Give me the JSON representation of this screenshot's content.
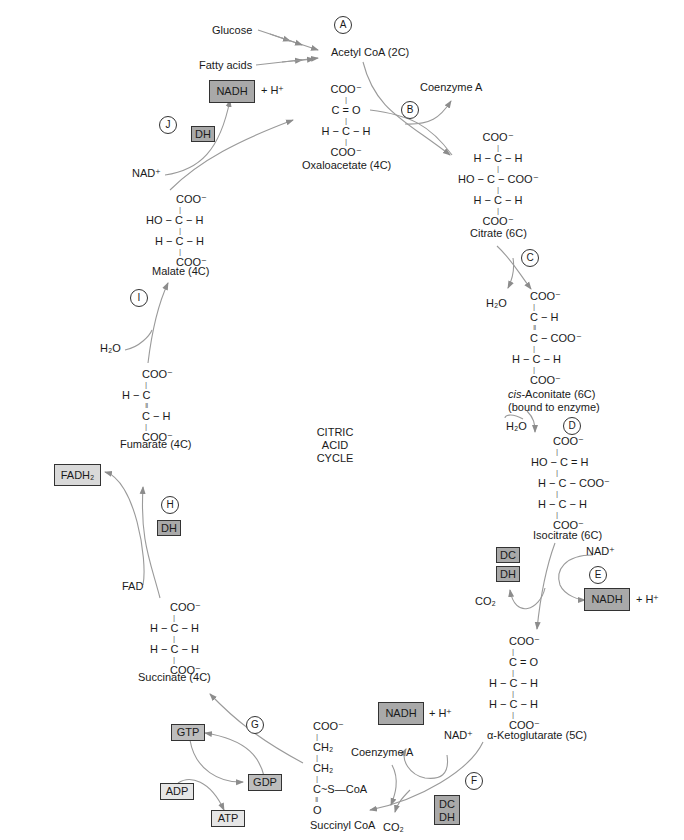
{
  "diagram": {
    "title_lines": [
      "CITRIC",
      "ACID",
      "CYCLE"
    ]
  },
  "steps": [
    {
      "id": "A"
    },
    {
      "id": "B"
    },
    {
      "id": "C"
    },
    {
      "id": "D"
    },
    {
      "id": "E"
    },
    {
      "id": "F"
    },
    {
      "id": "G"
    },
    {
      "id": "H"
    },
    {
      "id": "I"
    },
    {
      "id": "J"
    }
  ],
  "inputs": {
    "glucose": "Glucose",
    "fatty_acids": "Fatty acids",
    "acetyl_coa": "Acetyl CoA (2C)",
    "coenzyme_a_b": "Coenzyme A",
    "coenzyme_a_f": "Coenzyme A"
  },
  "molecules": {
    "oxaloacetate": {
      "name": "Oxaloacetate (4C)",
      "rows": [
        "COO⁻",
        "|",
        "C = O",
        "|",
        "H − C − H",
        "|",
        "COO⁻"
      ]
    },
    "citrate": {
      "name": "Citrate (6C)",
      "rows": [
        "COO⁻",
        "|",
        "H − C − H",
        "|",
        "HO − C − COO⁻",
        "|",
        "H − C − H",
        "|",
        "COO⁻"
      ]
    },
    "cis_aconitate": {
      "name_italic": "cis",
      "name_rest": "-Aconitate (6C)",
      "subtitle": "(bound to enzyme)",
      "rows": [
        "COO⁻",
        "|",
        "C − H",
        "‖",
        "C − COO⁻",
        "|",
        "H − C − H",
        "|",
        "COO⁻"
      ]
    },
    "isocitrate": {
      "name": "Isocitrate (6C)",
      "rows": [
        "COO⁻",
        "|",
        "HO − C = H",
        "|",
        "H − C − COO⁻",
        "|",
        "H − C − H",
        "|",
        "COO⁻"
      ]
    },
    "alpha_ketoglutarate": {
      "name": "α-Ketoglutarate (5C)",
      "rows": [
        "COO⁻",
        "|",
        "C = O",
        "|",
        "H − C − H",
        "|",
        "H − C − H",
        "|",
        "COO⁻"
      ]
    },
    "succinyl_coa": {
      "name": "Succinyl CoA",
      "rows": [
        "COO⁻",
        "|",
        "CH₂",
        "|",
        "CH₂",
        "|",
        "C~S—CoA",
        "‖",
        "O"
      ]
    },
    "succinate": {
      "name": "Succinate (4C)",
      "rows": [
        "COO⁻",
        "|",
        "H − C − H",
        "|",
        "H − C − H",
        "|",
        "COO⁻"
      ]
    },
    "fumarate": {
      "name": "Fumarate (4C)",
      "rows": [
        "COO⁻",
        "|",
        "H − C",
        "‖",
        "C − H",
        "|",
        "COO⁻"
      ]
    },
    "malate": {
      "name": "Malate (4C)",
      "rows": [
        "COO⁻",
        "|",
        "HO − C − H",
        "|",
        "H − C − H",
        "|",
        "COO⁻"
      ]
    }
  },
  "cofactors": {
    "nadh_j": "NADH",
    "h_plus_j": "+ H⁺",
    "nad_j": "NAD⁺",
    "dh_j": "DH",
    "h2o_c": "H₂O",
    "h2o_d": "H₂O",
    "nad_e": "NAD⁺",
    "dc_e": "DC",
    "dh_e": "DH",
    "co2_e": "CO₂",
    "nadh_e": "NADH",
    "h_plus_e": "+ H⁺",
    "nadh_f": "NADH",
    "h_plus_f": "+ H⁺",
    "nad_f": "NAD⁺",
    "dc_f": "DC",
    "dh_f": "DH",
    "co2_f": "CO₂",
    "gtp": "GTP",
    "gdp": "GDP",
    "adp": "ADP",
    "atp": "ATP",
    "fadh2": "FADH₂",
    "fad": "FAD",
    "dh_h": "DH",
    "h2o_i": "H₂O"
  },
  "colors": {
    "arrow": "#8c8c8c",
    "enzyme_box": "#a9a9a9",
    "nadh_box": "#a9a9a9",
    "gtp_box": "#bdbdbd",
    "fadh2_box": "#d9d9d9",
    "adp_atp_box": "#e6e6e6"
  }
}
